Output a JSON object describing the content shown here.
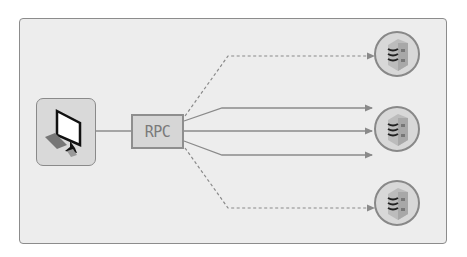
{
  "diagram": {
    "client": {
      "label": "",
      "icon": "desktop-computer-icon"
    },
    "rpc": {
      "label": "RPC"
    },
    "servers": [
      {
        "id": "server-1",
        "icon": "server-icon"
      },
      {
        "id": "server-2",
        "icon": "server-icon"
      },
      {
        "id": "server-3",
        "icon": "server-icon"
      }
    ],
    "connections": [
      {
        "from": "rpc",
        "to": "server-1",
        "style": "dashed"
      },
      {
        "from": "rpc",
        "to": "server-2",
        "style": "solid"
      },
      {
        "from": "rpc",
        "to": "server-2",
        "style": "solid"
      },
      {
        "from": "rpc",
        "to": "server-2",
        "style": "solid"
      },
      {
        "from": "rpc",
        "to": "server-3",
        "style": "dashed"
      },
      {
        "from": "client",
        "to": "rpc",
        "style": "solid"
      }
    ],
    "colors": {
      "background": "#ededed",
      "stroke": "#8c8c8c",
      "box_fill": "#d6d6d6"
    }
  }
}
